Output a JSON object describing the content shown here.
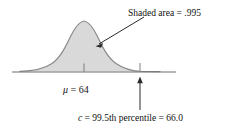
{
  "figure": {
    "background_color": "#ffffff",
    "curve_color": "#6f6f6f",
    "fill_color": "#d9d9d9",
    "axis_color": "#6f6f6f",
    "text_color": "#111111",
    "width": 228,
    "height": 132
  },
  "labels": {
    "shaded_area": "Shaded area = .995",
    "mean": "μ = 64",
    "mean_symbol": "μ",
    "mean_equals": "=",
    "mean_value": "64",
    "percentile": "c = 99.5th percentile = 66.0",
    "percentile_symbol": "c",
    "percentile_text": "99.5th percentile",
    "percentile_value": "66.0"
  },
  "chart_data": {
    "type": "area",
    "xlabel": "",
    "ylabel": "",
    "grid": false,
    "legend": null,
    "distribution": "normal",
    "mean": 64,
    "shaded_area_proportion": 0.995,
    "percentile": 99.5,
    "percentile_value": 66.0,
    "annotations": [
      {
        "name": "shaded-area-callout",
        "text": "Shaded area = .995",
        "points_to": "shaded region"
      },
      {
        "name": "mean-tick",
        "text": "μ = 64",
        "points_to": "axis at mean"
      },
      {
        "name": "percentile-arrow",
        "text": "c = 99.5th percentile = 66.0",
        "points_to": "axis at c"
      }
    ],
    "axis": {
      "x_start_px": 12,
      "x_end_px": 176,
      "baseline_y_px": 72,
      "mean_x_px": 84,
      "c_x_px": 140,
      "peak_y_px": 21
    }
  }
}
